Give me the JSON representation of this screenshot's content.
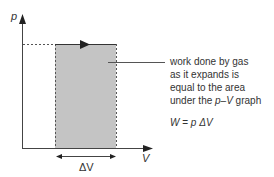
{
  "diagram": {
    "type": "p-V graph",
    "axes": {
      "y_label": "p",
      "x_label": "V"
    },
    "interval_label": "ΔV",
    "description_lines": [
      "work done by gas",
      "as it expands is",
      "equal to the area",
      "under the p–V graph"
    ],
    "description_line4_prefix": "under the ",
    "description_line4_p": "p",
    "description_line4_dash": "–",
    "description_line4_V": "V",
    "description_line4_suffix": " graph",
    "formula": {
      "W": "W",
      "eq": " = ",
      "p": "p",
      "dV": " ΔV"
    },
    "colors": {
      "area_fill": "#c4c4c4",
      "line": "#333333"
    }
  }
}
